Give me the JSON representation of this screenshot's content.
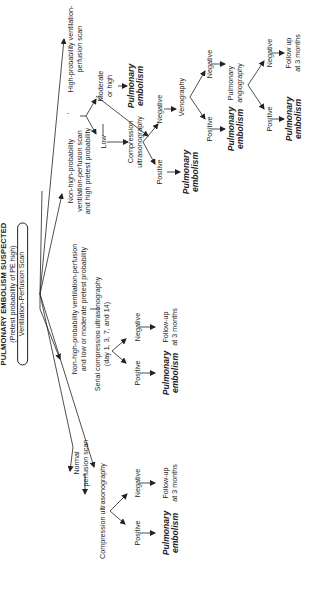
{
  "diagram": {
    "title": "PULMONARY EMBOLISM SUSPECTED",
    "subtitle": "(Pretest probability of PE high)",
    "root_test": "Ventilation-Perfusion Scan",
    "branches": {
      "normal": {
        "label_lines": [
          "Normal",
          "perfusion scan"
        ],
        "test": "Compression ultrasonography",
        "positive": "Positive",
        "negative": "Negative",
        "positive_outcome_lines": [
          "Pulmonary",
          "embolism"
        ],
        "negative_outcome_lines": [
          "Follow-up",
          "at 3 months"
        ]
      },
      "nonhigh_low": {
        "label_lines": [
          "Non-high-probability ventilation-perfusion",
          "and low or moderate pretest probability"
        ],
        "test_lines": [
          "Serial compression ultrasonography",
          "(day 1, 3, 7, and 14)"
        ],
        "positive": "Positive",
        "negative": "Negative",
        "positive_outcome_lines": [
          "Pulmonary",
          "embolism"
        ],
        "negative_outcome_lines": [
          "Follow-up",
          "at 3 months"
        ]
      },
      "nonhigh_high": {
        "label_lines": [
          "Non-high-probability",
          "ventilation-perfusion scan",
          "and high pretest probability"
        ]
      },
      "high": {
        "label_lines": [
          "High-probability ventilation-",
          "perfusion scan"
        ],
        "moderate_lines": [
          "Moderate",
          "or high"
        ],
        "moderate_outcome_lines": [
          "Pulmonary",
          "embolism"
        ],
        "low": "Low",
        "compression_lines": [
          "Compression",
          "ultrasonography"
        ],
        "cu_positive": "Positive",
        "cu_positive_outcome_lines": [
          "Pulmonary",
          "embolism"
        ],
        "cu_negative": "Negative",
        "venography": "Venography",
        "ven_positive": "Positive",
        "ven_positive_outcome_lines": [
          "Pulmonary",
          "embolism"
        ],
        "ven_negative": "Negative",
        "angiography_lines": [
          "Pulmonary",
          "angiography"
        ],
        "ang_positive": "Positive",
        "ang_positive_outcome_lines": [
          "Pulmonary",
          "embolism"
        ],
        "ang_negative": "Negative",
        "ang_negative_outcome_lines": [
          "Follow up",
          "at 3  months"
        ]
      }
    }
  }
}
